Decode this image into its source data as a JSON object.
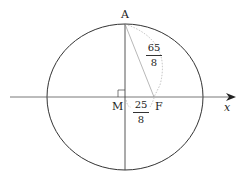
{
  "diagram": {
    "points": {
      "A": "A",
      "M": "M",
      "F": "F"
    },
    "axis_label": "x",
    "segments": {
      "AF": {
        "numerator": "65",
        "denominator": "8"
      },
      "MF": {
        "numerator": "25",
        "denominator": "8"
      }
    },
    "colors": {
      "stroke": "#333333",
      "background": "#ffffff"
    }
  }
}
